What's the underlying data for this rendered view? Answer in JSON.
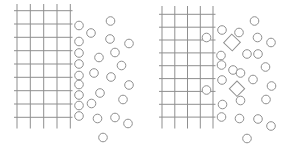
{
  "figure": {
    "width": 291,
    "height": 149,
    "background_color": "#ffffff",
    "stroke_color": "#8f8f8f",
    "stroke_width": 1,
    "circle_radius": 4.3,
    "panels": [
      {
        "name": "left-panel",
        "grid": {
          "vlines_x": [
            17,
            30.3,
            43.7,
            57,
            70.3
          ],
          "hlines_y": [
            10.7,
            24,
            37.3,
            50.7,
            64,
            77.3,
            90.7,
            104,
            117.3
          ],
          "vline_top": 4,
          "vline_bottom": 128.5,
          "hline_left": 14,
          "hline_right": 72.5
        },
        "grid_circles": [],
        "circles": [
          [
            110.5,
            21
          ],
          [
            79,
            25.5
          ],
          [
            91,
            33
          ],
          [
            79,
            41.5
          ],
          [
            110,
            39
          ],
          [
            129,
            43.5
          ],
          [
            79,
            53
          ],
          [
            115,
            52.5
          ],
          [
            99,
            57.5
          ],
          [
            79,
            64
          ],
          [
            121.5,
            65.5
          ],
          [
            94,
            73
          ],
          [
            79,
            75.5
          ],
          [
            111,
            77
          ],
          [
            79,
            84.5
          ],
          [
            129,
            85
          ],
          [
            100,
            93
          ],
          [
            79,
            95
          ],
          [
            123,
            99.5
          ],
          [
            91.5,
            103.5
          ],
          [
            79,
            105.5
          ],
          [
            79,
            116
          ],
          [
            97.5,
            118.5
          ],
          [
            115,
            117.5
          ],
          [
            128,
            123.5
          ],
          [
            103,
            137.5
          ]
        ],
        "squares": []
      },
      {
        "name": "right-panel",
        "grid": {
          "vlines_x": [
            162,
            174.8,
            187.5,
            200.3,
            213
          ],
          "hlines_y": [
            14.3,
            27.2,
            40,
            52.9,
            65.7,
            78.6,
            91.4,
            104.3,
            117.1
          ],
          "vline_top": 6,
          "vline_bottom": 128.5,
          "hline_left": 159,
          "hline_right": 215.5
        },
        "grid_circles": [
          [
            206.5,
            37.5
          ],
          [
            206.5,
            90
          ]
        ],
        "circles": [
          [
            254.5,
            21
          ],
          [
            222,
            30
          ],
          [
            239,
            32.5
          ],
          [
            257.5,
            37.5
          ],
          [
            271,
            42.5
          ],
          [
            221,
            55.5
          ],
          [
            247,
            54
          ],
          [
            258,
            54
          ],
          [
            221.5,
            65
          ],
          [
            265.5,
            67
          ],
          [
            233,
            70
          ],
          [
            240.5,
            73
          ],
          [
            222,
            80
          ],
          [
            253,
            79.5
          ],
          [
            271.5,
            86
          ],
          [
            240.5,
            100.5
          ],
          [
            266,
            99.5
          ],
          [
            222.5,
            104.5
          ],
          [
            221.5,
            117
          ],
          [
            239.5,
            118.5
          ],
          [
            258,
            119
          ],
          [
            271,
            126
          ],
          [
            247,
            138.5
          ]
        ],
        "squares": [
          {
            "cx": 232,
            "cy": 42.5,
            "side": 11.8,
            "rotation": 43
          },
          {
            "cx": 237,
            "cy": 88.7,
            "side": 10.8,
            "rotation": 45
          }
        ]
      }
    ]
  }
}
